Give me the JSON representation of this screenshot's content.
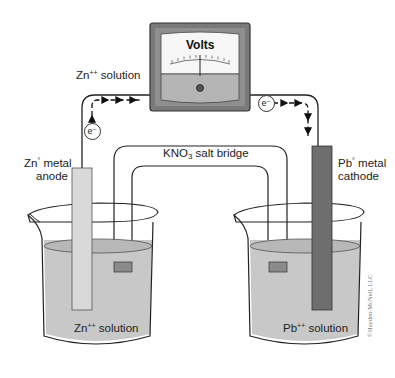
{
  "diagram": {
    "meter": {
      "label": "Volts"
    },
    "labels": {
      "top_left": {
        "main": "Zn",
        "sup": "++",
        "rest": " solution"
      },
      "anode_line1": {
        "main": "Zn",
        "sup": "°",
        "rest": " metal"
      },
      "anode_line2": "anode",
      "cathode_line1": {
        "main": "Pb",
        "sup": "°",
        "rest": " metal"
      },
      "cathode_line2": "cathode",
      "salt_bridge": {
        "main": "KNO",
        "sub": "3",
        "rest": " salt bridge"
      },
      "left_beaker": {
        "main": "Zn",
        "sup": "++",
        "rest": " solution"
      },
      "right_beaker": {
        "main": "Pb",
        "sup": "++",
        "rest": " solution"
      }
    },
    "electron_left": "e⁻",
    "electron_right": "e⁻",
    "copyright": "©Hayden-McNeil, LLC",
    "colors": {
      "zn_electrode": "#d9d9d9",
      "pb_electrode": "#6e6e6e",
      "solution": "#c8c8c8",
      "meter_body": "#7a7a7a",
      "meter_lower": "#b5b5b5",
      "salt_plug": "#8a8a8a"
    }
  }
}
